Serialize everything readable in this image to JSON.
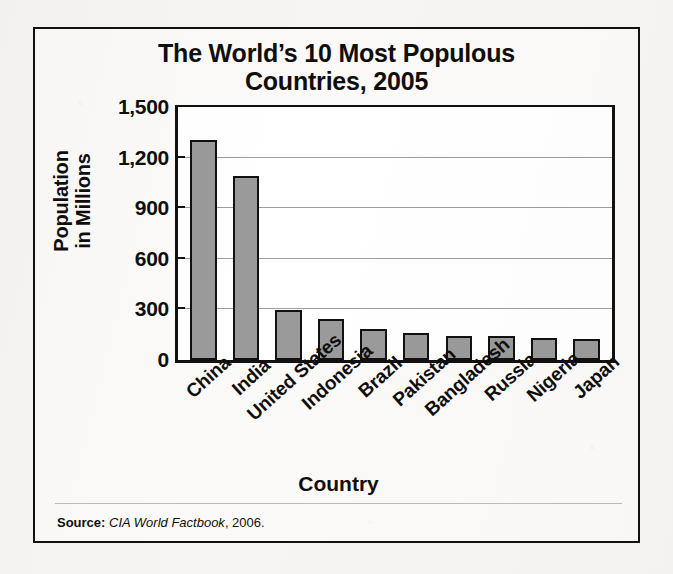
{
  "chart_data": {
    "type": "bar",
    "title_lines": [
      "The World’s 10 Most Populous",
      "Countries, 2005"
    ],
    "xlabel": "Country",
    "ylabel": "Population in Millions",
    "ylabel_lines": [
      "Population",
      "in Millions"
    ],
    "categories": [
      "China",
      "India",
      "United States",
      "Indonesia",
      "Brazil",
      "Pakistan",
      "Bangladesh",
      "Russia",
      "Nigeria",
      "Japan"
    ],
    "values": [
      1306,
      1090,
      296,
      242,
      186,
      162,
      144,
      143,
      129,
      127
    ],
    "ylim": [
      0,
      1500
    ],
    "yticks": [
      0,
      300,
      600,
      900,
      1200,
      1500
    ],
    "ytick_labels": [
      "0",
      "300",
      "600",
      "900",
      "1,200",
      "1,500"
    ],
    "grid": true,
    "legend": "none",
    "bar_fill_color": "#9a9a9a",
    "bar_edge_color": "#13110f",
    "plot_background": "#ffffff"
  },
  "source": {
    "label": "Source:",
    "work": "CIA World Factbook",
    "year": ", 2006."
  }
}
